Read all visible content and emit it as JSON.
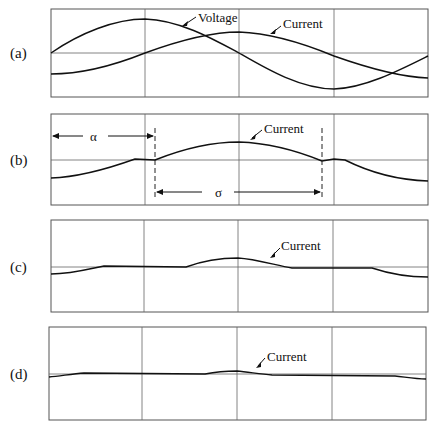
{
  "panels": [
    {
      "id": "a",
      "label": "(a)",
      "annotations": [
        "Voltage",
        "Current"
      ]
    },
    {
      "id": "b",
      "label": "(b)",
      "annotations": [
        "Current",
        "α",
        "σ"
      ]
    },
    {
      "id": "c",
      "label": "(c)",
      "annotations": [
        "Current"
      ]
    },
    {
      "id": "d",
      "label": "(d)",
      "annotations": [
        "Current"
      ]
    }
  ],
  "labels": {
    "a": "(a)",
    "b": "(b)",
    "c": "(c)",
    "d": "(d)",
    "voltage": "Voltage",
    "current": "Current",
    "alpha": "α",
    "sigma": "σ"
  },
  "colors": {
    "trace": "#111111",
    "grid": "#666666",
    "background": "#ffffff"
  }
}
